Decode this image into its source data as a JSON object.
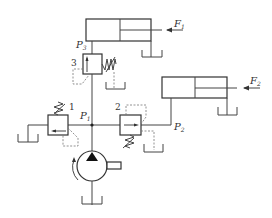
{
  "diagram": {
    "labels": {
      "force1": {
        "main": "F",
        "sub": "1"
      },
      "force2": {
        "main": "F",
        "sub": "2"
      },
      "pressure1": {
        "main": "P",
        "sub": "1"
      },
      "pressure2": {
        "main": "P",
        "sub": "2"
      },
      "pressure3": {
        "main": "P",
        "sub": "3"
      },
      "valve1_number": "1",
      "valve2_number": "2",
      "valve3_number": "3"
    },
    "components": [
      {
        "id": "pump",
        "type": "hydraulic-pump"
      },
      {
        "id": "valve1",
        "type": "relief-valve",
        "number": "1"
      },
      {
        "id": "valve2",
        "type": "pressure-reducing-valve",
        "number": "2"
      },
      {
        "id": "valve3",
        "type": "sequence-valve",
        "number": "3"
      },
      {
        "id": "cylinder1",
        "type": "hydraulic-cylinder",
        "load": "F1"
      },
      {
        "id": "cylinder2",
        "type": "hydraulic-cylinder",
        "load": "F2"
      }
    ],
    "colors": {
      "line": "#444444",
      "dashed": "#777777",
      "background": "#ffffff"
    }
  }
}
